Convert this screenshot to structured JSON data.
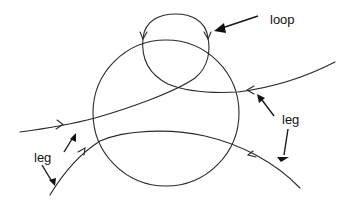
{
  "diagram": {
    "type": "knot/link diagram with circle, loop and legs",
    "labels": {
      "loop": "loop",
      "leg_left": "leg",
      "leg_right": "leg"
    },
    "colors": {
      "stroke": "#2a2a2a",
      "background": "#ffffff"
    }
  }
}
